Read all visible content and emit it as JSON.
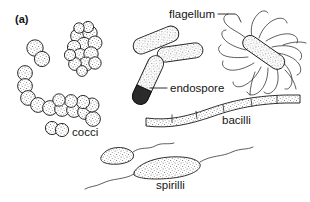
{
  "figure": {
    "panel_label": "(a)",
    "caption_topic": "bacterial cell shapes",
    "background_color": "#ffffff",
    "ink_color": "#1a1a1a",
    "endospore_fill_color": "#2b2b2b",
    "cell_fill": "stippled-gray"
  },
  "labels": {
    "flagellum": "flagellum",
    "endospore": "endospore",
    "bacilli": "bacilli",
    "cocci": "cocci",
    "spirilli": "spirilli"
  },
  "structures": {
    "cocci": {
      "name": "cocci",
      "single_cells": 2,
      "cluster_cells": 14,
      "chain_cells": 13,
      "diplococcus_cells": 2,
      "description": "round cells shown singly, in a grape-like cluster, in a chain, and as a pair"
    },
    "bacilli_rods": {
      "name": "rods",
      "plain_rods": 2,
      "endospore_rods": 1,
      "description": "rod shaped cells, one containing a dark terminal endospore"
    },
    "flagellated_rod": {
      "name": "flagellated rod",
      "flagella_count": 16,
      "arrangement": "peritrichous",
      "description": "rod surrounded by many wavy flagella"
    },
    "filamentous_bacilli": {
      "name": "bacilli",
      "segments": 6,
      "description": "long wavy filament divided by cross walls"
    },
    "spirilli": {
      "name": "spirilli",
      "cells": 2,
      "flagella_per_cell": 1,
      "description": "curved comma shaped cells each with a polar flagellum"
    }
  }
}
